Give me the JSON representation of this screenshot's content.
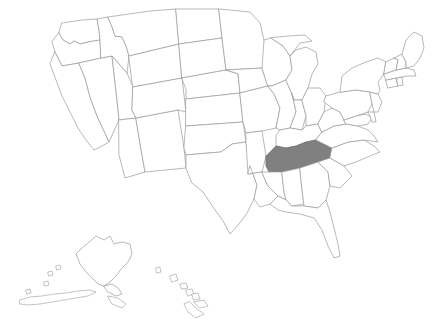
{
  "map": {
    "title": "United States map",
    "background_color": "#ffffff",
    "border_color": "#9a9a9a",
    "default_fill": "#ffffff",
    "highlight_fill": "#808080",
    "projection_note": "Albers-style continental US with Alaska and Hawaii insets",
    "highlighted_states": [
      "Tennessee"
    ],
    "insets": [
      {
        "name": "Alaska",
        "position": "lower-left"
      },
      {
        "name": "Hawaii",
        "position": "lower-center"
      }
    ],
    "states": [
      {
        "code": "WA",
        "name": "Washington",
        "highlighted": false
      },
      {
        "code": "OR",
        "name": "Oregon",
        "highlighted": false
      },
      {
        "code": "CA",
        "name": "California",
        "highlighted": false
      },
      {
        "code": "NV",
        "name": "Nevada",
        "highlighted": false
      },
      {
        "code": "ID",
        "name": "Idaho",
        "highlighted": false
      },
      {
        "code": "MT",
        "name": "Montana",
        "highlighted": false
      },
      {
        "code": "WY",
        "name": "Wyoming",
        "highlighted": false
      },
      {
        "code": "UT",
        "name": "Utah",
        "highlighted": false
      },
      {
        "code": "AZ",
        "name": "Arizona",
        "highlighted": false
      },
      {
        "code": "NM",
        "name": "New Mexico",
        "highlighted": false
      },
      {
        "code": "CO",
        "name": "Colorado",
        "highlighted": false
      },
      {
        "code": "ND",
        "name": "North Dakota",
        "highlighted": false
      },
      {
        "code": "SD",
        "name": "South Dakota",
        "highlighted": false
      },
      {
        "code": "NE",
        "name": "Nebraska",
        "highlighted": false
      },
      {
        "code": "KS",
        "name": "Kansas",
        "highlighted": false
      },
      {
        "code": "OK",
        "name": "Oklahoma",
        "highlighted": false
      },
      {
        "code": "TX",
        "name": "Texas",
        "highlighted": false
      },
      {
        "code": "MN",
        "name": "Minnesota",
        "highlighted": false
      },
      {
        "code": "IA",
        "name": "Iowa",
        "highlighted": false
      },
      {
        "code": "MO",
        "name": "Missouri",
        "highlighted": false
      },
      {
        "code": "AR",
        "name": "Arkansas",
        "highlighted": false
      },
      {
        "code": "LA",
        "name": "Louisiana",
        "highlighted": false
      },
      {
        "code": "WI",
        "name": "Wisconsin",
        "highlighted": false
      },
      {
        "code": "IL",
        "name": "Illinois",
        "highlighted": false
      },
      {
        "code": "MI",
        "name": "Michigan",
        "highlighted": false
      },
      {
        "code": "IN",
        "name": "Indiana",
        "highlighted": false
      },
      {
        "code": "OH",
        "name": "Ohio",
        "highlighted": false
      },
      {
        "code": "KY",
        "name": "Kentucky",
        "highlighted": false
      },
      {
        "code": "TN",
        "name": "Tennessee",
        "highlighted": true
      },
      {
        "code": "MS",
        "name": "Mississippi",
        "highlighted": false
      },
      {
        "code": "AL",
        "name": "Alabama",
        "highlighted": false
      },
      {
        "code": "GA",
        "name": "Georgia",
        "highlighted": false
      },
      {
        "code": "FL",
        "name": "Florida",
        "highlighted": false
      },
      {
        "code": "SC",
        "name": "South Carolina",
        "highlighted": false
      },
      {
        "code": "NC",
        "name": "North Carolina",
        "highlighted": false
      },
      {
        "code": "VA",
        "name": "Virginia",
        "highlighted": false
      },
      {
        "code": "WV",
        "name": "West Virginia",
        "highlighted": false
      },
      {
        "code": "MD",
        "name": "Maryland",
        "highlighted": false
      },
      {
        "code": "DE",
        "name": "Delaware",
        "highlighted": false
      },
      {
        "code": "PA",
        "name": "Pennsylvania",
        "highlighted": false
      },
      {
        "code": "NJ",
        "name": "New Jersey",
        "highlighted": false
      },
      {
        "code": "NY",
        "name": "New York",
        "highlighted": false
      },
      {
        "code": "CT",
        "name": "Connecticut",
        "highlighted": false
      },
      {
        "code": "RI",
        "name": "Rhode Island",
        "highlighted": false
      },
      {
        "code": "MA",
        "name": "Massachusetts",
        "highlighted": false
      },
      {
        "code": "VT",
        "name": "Vermont",
        "highlighted": false
      },
      {
        "code": "NH",
        "name": "New Hampshire",
        "highlighted": false
      },
      {
        "code": "ME",
        "name": "Maine",
        "highlighted": false
      },
      {
        "code": "AK",
        "name": "Alaska",
        "highlighted": false
      },
      {
        "code": "HI",
        "name": "Hawaii",
        "highlighted": false
      }
    ]
  }
}
